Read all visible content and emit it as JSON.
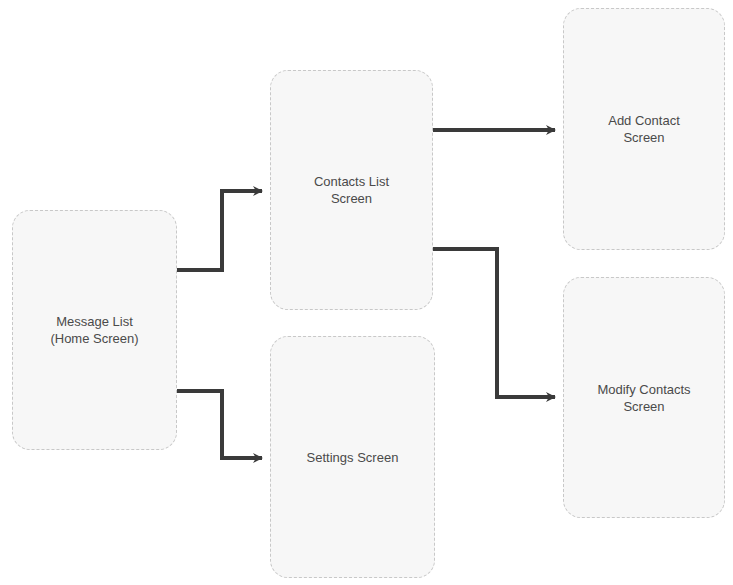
{
  "diagram": {
    "type": "screen-flow",
    "nodes": [
      {
        "id": "message-list",
        "label": "Message List\n(Home Screen)",
        "x": 12,
        "y": 210,
        "w": 165,
        "h": 240
      },
      {
        "id": "contacts-list",
        "label": "Contacts List\nScreen",
        "x": 270,
        "y": 70,
        "w": 163,
        "h": 240
      },
      {
        "id": "settings",
        "label": "Settings Screen",
        "x": 270,
        "y": 336,
        "w": 165,
        "h": 242
      },
      {
        "id": "add-contact",
        "label": "Add Contact\nScreen",
        "x": 563,
        "y": 8,
        "w": 162,
        "h": 242
      },
      {
        "id": "modify-contacts",
        "label": "Modify Contacts\nScreen",
        "x": 563,
        "y": 277,
        "w": 162,
        "h": 241
      }
    ],
    "edges": [
      {
        "from": "message-list",
        "to": "contacts-list"
      },
      {
        "from": "message-list",
        "to": "settings"
      },
      {
        "from": "contacts-list",
        "to": "add-contact"
      },
      {
        "from": "contacts-list",
        "to": "modify-contacts"
      }
    ],
    "colors": {
      "edge": "#3a3a3a",
      "node_fill": "#f7f7f7",
      "node_border": "#c8c8c8",
      "text": "#4a4a4a"
    }
  }
}
